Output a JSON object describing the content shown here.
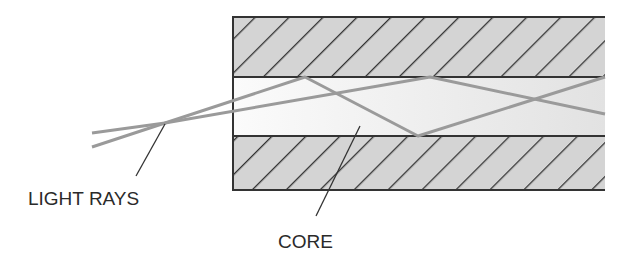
{
  "diagram": {
    "labels": {
      "light_rays": "LIGHT RAYS",
      "core": "CORE"
    },
    "colors": {
      "cladding_fill": "#d4d4d4",
      "core_fill": "#efefef",
      "hatch": "#333333",
      "border": "#333333",
      "ray": "#9a9a9a",
      "leader": "#333333",
      "text": "#2a2a2a"
    }
  }
}
